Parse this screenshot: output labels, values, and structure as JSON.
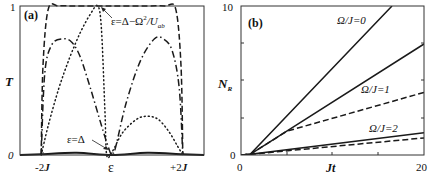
{
  "chart_data": [
    {
      "panel_label": "(a)",
      "type": "line",
      "title": "",
      "xlabel": "ε",
      "ylabel": "T",
      "xlim": [
        -2.6,
        2.6
      ],
      "ylim": [
        0,
        1
      ],
      "x_tick_labels": [
        "-2J",
        "ε",
        "+2J"
      ],
      "x_tick_positions": [
        -2,
        0,
        2
      ],
      "y_tick_labels": [
        "0",
        "1"
      ],
      "grid": false,
      "annotations": [
        {
          "text": "ε=Δ−Ω²/U_ab",
          "points_to": [
            -0.35,
            1.0
          ]
        },
        {
          "text": "ε=Δ",
          "points_to": [
            -0.1,
            0.02
          ]
        }
      ],
      "series": [
        {
          "name": "dashed",
          "style": "dashed",
          "x": [
            -2.0,
            -1.95,
            -1.8,
            -1.5,
            -1.0,
            0.0,
            1.0,
            1.5,
            1.8,
            1.95,
            2.0
          ],
          "y": [
            0.0,
            0.6,
            0.98,
            1.0,
            1.0,
            1.0,
            1.0,
            1.0,
            0.98,
            0.6,
            0.0
          ]
        },
        {
          "name": "dash-dot",
          "style": "dashdot",
          "x": [
            -2.0,
            -1.9,
            -1.7,
            -1.4,
            -1.15,
            -0.9,
            -0.6,
            -0.3,
            -0.1,
            0.0,
            0.1,
            0.4,
            0.8,
            1.2,
            1.45,
            1.7,
            1.9,
            2.0
          ],
          "y": [
            0.0,
            0.55,
            0.74,
            0.78,
            0.76,
            0.66,
            0.44,
            0.2,
            0.05,
            0.0,
            0.05,
            0.35,
            0.63,
            0.78,
            0.78,
            0.7,
            0.45,
            0.0
          ]
        },
        {
          "name": "dotted",
          "style": "dotted",
          "x": [
            -2.0,
            -1.8,
            -1.5,
            -1.2,
            -0.9,
            -0.6,
            -0.4,
            -0.3,
            -0.2,
            -0.15,
            0.0,
            0.3,
            0.7,
            1.0,
            1.3,
            1.6,
            1.85,
            2.0
          ],
          "y": [
            0.0,
            0.2,
            0.45,
            0.65,
            0.82,
            0.95,
            1.0,
            0.85,
            0.3,
            0.0,
            0.02,
            0.15,
            0.24,
            0.26,
            0.24,
            0.16,
            0.06,
            0.0
          ]
        },
        {
          "name": "solid",
          "style": "solid",
          "x": [
            -2.6,
            -2.0,
            -1.0,
            0.0,
            1.0,
            2.0,
            2.6
          ],
          "y": [
            0.0,
            0.005,
            0.015,
            0.0,
            0.015,
            0.005,
            0.0
          ]
        }
      ]
    },
    {
      "panel_label": "(b)",
      "type": "line",
      "title": "",
      "xlabel": "Jt",
      "ylabel": "N_R",
      "xlim": [
        0,
        20
      ],
      "ylim": [
        0,
        10
      ],
      "x_tick_labels": [
        "0",
        "20"
      ],
      "x_minor_ticks": [
        5,
        10,
        15
      ],
      "y_tick_labels": [
        "0",
        "10"
      ],
      "y_minor_ticks": [
        2.5,
        5,
        7.5
      ],
      "grid": false,
      "series": [
        {
          "name": "Ω/J=0 (solid)",
          "label": "Ω/J=0",
          "style": "solid",
          "x": [
            0,
            1,
            16.5
          ],
          "y": [
            0,
            0.05,
            10
          ]
        },
        {
          "name": "Ω/J=1 (solid)",
          "label": "Ω/J=1",
          "style": "solid",
          "x": [
            0,
            1,
            20
          ],
          "y": [
            0,
            0.05,
            7.45
          ]
        },
        {
          "name": "Ω/J=1 (dashed)",
          "style": "dashed",
          "x": [
            0,
            1,
            5,
            20
          ],
          "y": [
            0,
            0.05,
            1.6,
            4.2
          ]
        },
        {
          "name": "Ω/J=2 (solid)",
          "label": "Ω/J=2",
          "style": "solid",
          "x": [
            0,
            1,
            20
          ],
          "y": [
            0,
            0.05,
            1.5
          ]
        },
        {
          "name": "Ω/J=2 (dashed)",
          "style": "dashed",
          "x": [
            0,
            1,
            20
          ],
          "y": [
            0,
            0.05,
            1.15
          ]
        }
      ]
    }
  ],
  "panel_a": {
    "label": "(a)",
    "ylabel": "T",
    "y_top": "1",
    "y_bottom": "0",
    "x_left": "-2",
    "x_right": "+2",
    "x_unit": "J",
    "x_center": "ε",
    "annotation_top": {
      "prefix": "ε=Δ−Ω",
      "sup": "2",
      "mid": "/U",
      "sub": "ab"
    },
    "annotation_bottom": "ε=Δ"
  },
  "panel_b": {
    "label": "(b)",
    "ylabel_main": "N",
    "ylabel_sub": "R",
    "y_top": "10",
    "y_bottom": "0",
    "x_left": "0",
    "x_right": "20",
    "xlabel": "Jt",
    "curve_labels": [
      "Ω/J=0",
      "Ω/J=1",
      "Ω/J=2"
    ]
  }
}
